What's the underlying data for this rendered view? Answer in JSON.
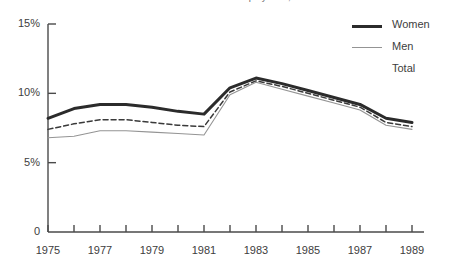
{
  "chart_title": "Percent of Labor Force in Self-Employment, 1975 to 1989",
  "axes": {
    "y_ticks": [
      "15%",
      "10%",
      "5%",
      "0"
    ],
    "x_ticks": [
      "1975",
      "1977",
      "1979",
      "1981",
      "1983",
      "1985",
      "1987",
      "1989"
    ]
  },
  "legend": {
    "position": "top-right",
    "items": [
      {
        "label": "Women",
        "style": "thick-solid",
        "color": "#2b2b2b"
      },
      {
        "label": "Men",
        "style": "thin-solid",
        "color": "#949494"
      },
      {
        "label": "Total",
        "style": "dashed",
        "color": "#3a3a3a"
      }
    ]
  },
  "chart_data": {
    "type": "line",
    "title": "Percent of Labor Force in Self-Employment, 1975 to 1989",
    "xlabel": "",
    "ylabel": "",
    "xlim": [
      1975,
      1989
    ],
    "ylim": [
      0,
      15
    ],
    "grid": false,
    "y_tick_values": [
      0,
      5,
      10,
      15
    ],
    "y_tick_labels": [
      "0",
      "5%",
      "10%",
      "15%"
    ],
    "x": [
      1975,
      1976,
      1977,
      1978,
      1979,
      1980,
      1981,
      1982,
      1983,
      1984,
      1985,
      1986,
      1987,
      1988,
      1989
    ],
    "x_tick_values": [
      1975,
      1977,
      1979,
      1981,
      1983,
      1985,
      1987,
      1989
    ],
    "x_tick_labels": [
      "1975",
      "1977",
      "1979",
      "1981",
      "1983",
      "1985",
      "1987",
      "1989"
    ],
    "series": [
      {
        "name": "Women",
        "style": "thick-solid",
        "color": "#2b2b2b",
        "values": [
          8.2,
          8.9,
          9.2,
          9.2,
          9.0,
          8.7,
          8.5,
          10.4,
          11.1,
          10.7,
          10.2,
          9.7,
          9.2,
          8.2,
          7.9
        ]
      },
      {
        "name": "Total",
        "style": "dashed",
        "color": "#3a3a3a",
        "values": [
          7.4,
          7.8,
          8.1,
          8.1,
          7.9,
          7.7,
          7.6,
          10.1,
          10.9,
          10.5,
          10.0,
          9.5,
          9.0,
          7.9,
          7.6
        ]
      },
      {
        "name": "Men",
        "style": "thin-solid",
        "color": "#949494",
        "values": [
          6.8,
          6.9,
          7.3,
          7.3,
          7.2,
          7.1,
          7.0,
          9.9,
          10.8,
          10.3,
          9.8,
          9.3,
          8.8,
          7.7,
          7.4
        ]
      }
    ]
  }
}
